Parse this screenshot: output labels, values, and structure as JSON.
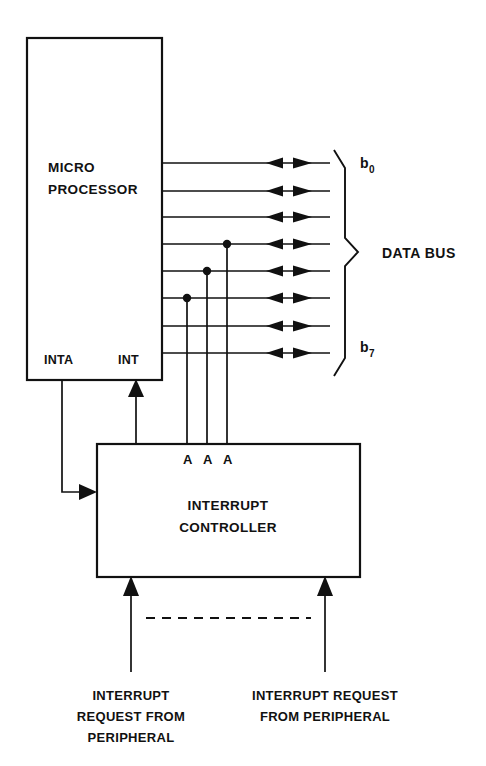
{
  "diagram": {
    "colors": {
      "line": "#111111",
      "background": "#ffffff",
      "text": "#111111"
    },
    "blocks": {
      "cpu": {
        "name": "micro-processor-block",
        "label_line1": "MICRO",
        "label_line2": "PROCESSOR",
        "pins": {
          "inta": "INTA",
          "int": "INT"
        }
      },
      "controller": {
        "name": "interrupt-controller-block",
        "label_line1": "INTERRUPT",
        "label_line2": "CONTROLLER",
        "address_pins": [
          "A",
          "A",
          "A"
        ]
      }
    },
    "bus": {
      "label": "DATA BUS",
      "first_bit_label": "b",
      "first_bit_sub": "0",
      "last_bit_label": "b",
      "last_bit_sub": "7",
      "line_count": 8,
      "bidirectional": true,
      "tapped_lines": [
        4,
        5,
        6
      ]
    },
    "captions": {
      "left": {
        "name": "interrupt-request-left-caption",
        "lines": [
          "INTERRUPT",
          "REQUEST FROM",
          "PERIPHERAL"
        ]
      },
      "right": {
        "name": "interrupt-request-right-caption",
        "lines": [
          "INTERRUPT REQUEST",
          "FROM PERIPHERAL"
        ]
      }
    },
    "connections": {
      "inta_path": "INTA acknowledge from processor to interrupt controller",
      "int_path": "INT request from interrupt controller to processor",
      "dashed_separator": "additional peripheral interrupt lines"
    }
  }
}
